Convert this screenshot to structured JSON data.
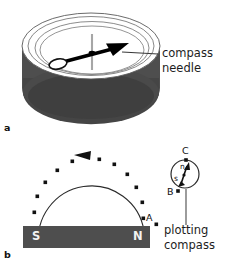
{
  "figure": {
    "title_absent": true,
    "panels": [
      {
        "id": "a",
        "id_label": "a",
        "description": "three-dimensional drawing of a magnetic compass seen at an angle",
        "annotation": {
          "text_line1": "compass",
          "text_line2": "needle",
          "leader_from": [
            155,
            57
          ],
          "leader_to": [
            118,
            57
          ]
        },
        "colors": {
          "case_body": "#4e4e4e",
          "case_body_shadow": "#3c3c3c",
          "dial_face": "#ffffff",
          "rim_line": "#4a4a4a",
          "needle": "#000000",
          "pivot_line": "#9a9a9a"
        }
      },
      {
        "id": "b",
        "id_label": "b",
        "description": "plan view of field line plotted around a bar magnet using a plotting compass",
        "magnet": {
          "south_label": "S",
          "north_label": "N",
          "fill": "#4e4e4e",
          "x": 23,
          "y": 226,
          "width": 127,
          "height": 22
        },
        "field_line": {
          "dot_count": 14,
          "arrow_at_top": true,
          "arrow_direction": "anticlockwise-left",
          "stroke": "#2b2b2b"
        },
        "points": [
          {
            "label": "A",
            "x": 148,
            "y": 219
          },
          {
            "label": "B",
            "x": 170,
            "y": 194
          },
          {
            "label": "C",
            "x": 186,
            "y": 153
          }
        ],
        "plotting_compass": {
          "label_line1": "plotting",
          "label_line2": "compass",
          "north_pole_letter": "n",
          "south_pole_letter": "s",
          "circle_center": [
            185,
            174
          ],
          "circle_radius": 14
        },
        "colors": {
          "dot": "#111111",
          "text": "#1d1d1d"
        }
      }
    ]
  }
}
